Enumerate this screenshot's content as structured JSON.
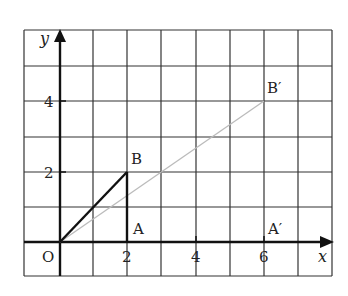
{
  "diagram": {
    "type": "coordinate-grid-enlargement",
    "axes": {
      "x_label": "x",
      "y_label": "y",
      "x_ticks": [
        "2",
        "4",
        "6"
      ],
      "y_ticks": [
        "2",
        "4"
      ],
      "origin_label": "O"
    },
    "points": {
      "O": {
        "label": "O",
        "x": 0,
        "y": 0
      },
      "A": {
        "label": "A",
        "x": 2,
        "y": 0
      },
      "B": {
        "label": "B",
        "x": 2,
        "y": 2
      },
      "A_prime": {
        "label": "A′",
        "x": 6,
        "y": 0
      },
      "B_prime": {
        "label": "B′",
        "x": 6,
        "y": 4
      }
    },
    "segments": [
      {
        "from": "O",
        "to": "B",
        "style": "bold"
      },
      {
        "from": "B",
        "to": "A",
        "style": "bold"
      },
      {
        "from": "O",
        "to": "B_prime",
        "style": "light-gray"
      }
    ],
    "grid": {
      "x_range": [
        -1,
        8
      ],
      "y_range": [
        -1,
        6
      ],
      "step": 1
    },
    "colors": {
      "grid": "#333333",
      "triangle": "#111111",
      "ray": "#bbbbbb"
    }
  }
}
